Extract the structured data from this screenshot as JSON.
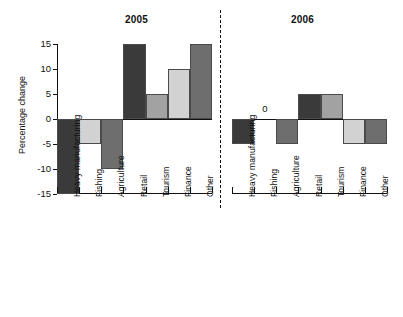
{
  "chart_data": {
    "type": "bar",
    "title": "",
    "xlabel": "",
    "ylabel": "Percentage change",
    "ylim": [
      -15,
      15
    ],
    "yticks": [
      15,
      10,
      5,
      0,
      -5,
      -10,
      -15
    ],
    "ytick_labels": [
      "15",
      "10",
      "5",
      "0",
      "-5",
      "-10",
      "-15"
    ],
    "grid": false,
    "legend": "none",
    "panels": [
      {
        "name": "2005",
        "label": "2005",
        "categories": [
          "Heavy manufacturing",
          "Fishing",
          "Agriculture",
          "Retail",
          "Tourism",
          "Finance",
          "Other"
        ],
        "values": [
          -15,
          -5,
          -10,
          15,
          5,
          10,
          15
        ],
        "value_labels": [
          "",
          "",
          "",
          "",
          "",
          "",
          ""
        ],
        "colors": [
          "#3a3a3a",
          "#d2d2d2",
          "#6e6e6e",
          "#3a3a3a",
          "#a2a2a2",
          "#d2d2d2",
          "#6e6e6e"
        ]
      },
      {
        "name": "2006",
        "label": "2006",
        "categories": [
          "Heavy manufacturing",
          "Fishing",
          "Agriculture",
          "Retail",
          "Tourism",
          "Finance",
          "Other"
        ],
        "values": [
          -5,
          0,
          -5,
          5,
          5,
          -5,
          -5
        ],
        "value_labels": [
          "",
          "0",
          "",
          "",
          "",
          "",
          ""
        ],
        "colors": [
          "#3a3a3a",
          "#ffffff",
          "#6e6e6e",
          "#3a3a3a",
          "#a2a2a2",
          "#d2d2d2",
          "#6e6e6e"
        ]
      }
    ],
    "divider": "dashed-vertical-between-panels",
    "bar_border_color": "#4a4a4a",
    "axis_color": "#111111"
  }
}
